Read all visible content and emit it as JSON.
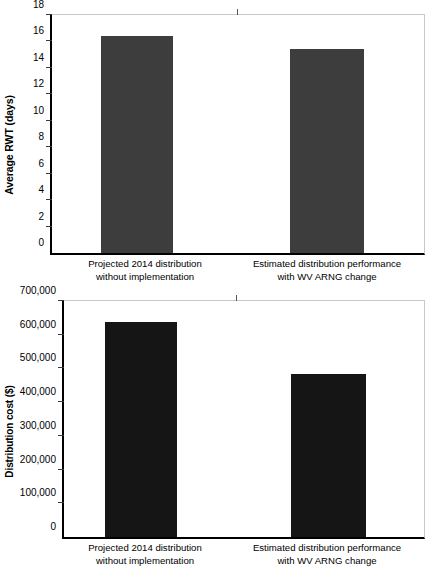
{
  "chart_data": [
    {
      "id": "rwt",
      "type": "bar",
      "title": "",
      "xlabel": "",
      "ylabel": "Average RWT (days)",
      "categories": [
        "Projected 2014 distribution without implementation",
        "Estimated distribution performance with WV ARNG change"
      ],
      "category_lines": [
        [
          "Projected 2014 distribution",
          "without implementation"
        ],
        [
          "Estimated distribution performance",
          "with WV ARNG change"
        ]
      ],
      "values": [
        16.4,
        15.4
      ],
      "ylim": [
        0,
        18
      ],
      "yticks": [
        0,
        2,
        4,
        6,
        8,
        10,
        12,
        14,
        16,
        18
      ],
      "ytick_labels": [
        "0",
        "2",
        "4",
        "6",
        "8",
        "10",
        "12",
        "14",
        "16",
        "18"
      ],
      "grid": false,
      "legend": false,
      "bar_color": "#3d3d3d"
    },
    {
      "id": "cost",
      "type": "bar",
      "title": "",
      "xlabel": "",
      "ylabel": "Distribution cost ($)",
      "categories": [
        "Projected 2014 distribution without implementation",
        "Estimated distribution performance with WV ARNG change"
      ],
      "category_lines": [
        [
          "Projected 2014 distribution",
          "without implementation"
        ],
        [
          "Estimated distribution performance",
          "with WV ARNG change"
        ]
      ],
      "values": [
        637000,
        485000
      ],
      "ylim": [
        0,
        700000
      ],
      "yticks": [
        0,
        100000,
        200000,
        300000,
        400000,
        500000,
        600000,
        700000
      ],
      "ytick_labels": [
        "0",
        "100,000",
        "200,000",
        "300,000",
        "400,000",
        "500,000",
        "600,000",
        "700,000"
      ],
      "grid": false,
      "legend": false,
      "bar_color": "#151515"
    }
  ],
  "charts": {
    "rwt": {
      "ylabel": "Average RWT (days)",
      "yticks": {
        "t0": "0",
        "t1": "2",
        "t2": "4",
        "t3": "6",
        "t4": "8",
        "t5": "10",
        "t6": "12",
        "t7": "14",
        "t8": "16",
        "t9": "18"
      },
      "cat1_line1": "Projected 2014 distribution",
      "cat1_line2": "without implementation",
      "cat2_line1": "Estimated distribution performance",
      "cat2_line2": "with WV ARNG change"
    },
    "cost": {
      "ylabel": "Distribution cost ($)",
      "yticks": {
        "t0": "0",
        "t1": "100,000",
        "t2": "200,000",
        "t3": "300,000",
        "t4": "400,000",
        "t5": "500,000",
        "t6": "600,000",
        "t7": "700,000"
      },
      "cat1_line1": "Projected 2014 distribution",
      "cat1_line2": "without implementation",
      "cat2_line1": "Estimated distribution performance",
      "cat2_line2": "with WV ARNG change"
    }
  }
}
